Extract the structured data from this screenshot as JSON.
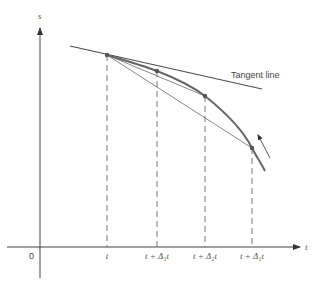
{
  "diagram": {
    "axes": {
      "y_label": "s",
      "x_label": "t",
      "origin_label": "0"
    },
    "annotation": "Tangent line",
    "tick_labels": [
      {
        "text": "t",
        "x": 107
      },
      {
        "text": "t + Δ₃t",
        "x": 157
      },
      {
        "text": "t + Δ₂t",
        "x": 205
      },
      {
        "text": "t + Δ₁t",
        "x": 252
      }
    ],
    "points": [
      {
        "name": "P(t)",
        "x": 107,
        "y": 55
      },
      {
        "name": "P(t+Δ3t)",
        "x": 157,
        "y": 71
      },
      {
        "name": "P(t+Δ2t)",
        "x": 205,
        "y": 96
      },
      {
        "name": "P(t+Δ1t)",
        "x": 252,
        "y": 148
      }
    ],
    "colors": {
      "curve": "#666666",
      "line": "#444444",
      "text": "#444444"
    }
  }
}
